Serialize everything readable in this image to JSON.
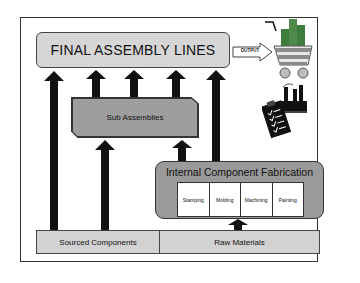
{
  "diagram": {
    "final_assembly": {
      "label": "FINAL ASSEMBLY LINES"
    },
    "output_arrow": {
      "label": "OUTPUT"
    },
    "sub_assemblies": {
      "label": "Sub Assemblies"
    },
    "internal_fabrication": {
      "title": "Internal Component Fabrication",
      "processes": [
        "Stamping",
        "Molding",
        "Machining",
        "Painting"
      ]
    },
    "sourced_components": {
      "label": "Sourced Components"
    },
    "raw_materials": {
      "label": "Raw Materials"
    },
    "icons": [
      "shopping-cart-icon",
      "factory-icon",
      "clipboard-checklist-icon"
    ],
    "colors": {
      "light_box": "#d6d6d6",
      "mid_box": "#9e9e9e",
      "arrow": "#111111",
      "cart_green": "#4f8a4a",
      "cart_bar": "#9e9e9e",
      "cart_stripe": "#8a8a8a"
    }
  }
}
